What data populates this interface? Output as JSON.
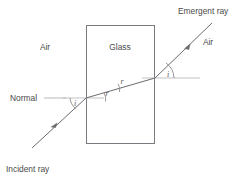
{
  "diagram": {
    "background_color": "#ffffff",
    "ray_color": "#6b6b70",
    "block_color": "#7a7a80",
    "normal_color": "#c2c2c6",
    "text_color": "#4a4a4a",
    "labels": {
      "medium_left": "Air",
      "medium_block": "Glass",
      "medium_right": "Air",
      "normal": "Normal",
      "incident_ray": "Incident ray",
      "emergent_ray": "Emergent ray"
    },
    "angles": {
      "incidence": "i",
      "refraction_entry": "r",
      "refraction_inner": "r",
      "emergence": "i"
    },
    "geometry": {
      "block_left": 86,
      "block_right": 155,
      "block_top": 25,
      "block_bottom": 144,
      "entry_point_x": 86,
      "entry_point_y": 98,
      "exit_point_x": 155,
      "exit_point_y": 78
    }
  }
}
